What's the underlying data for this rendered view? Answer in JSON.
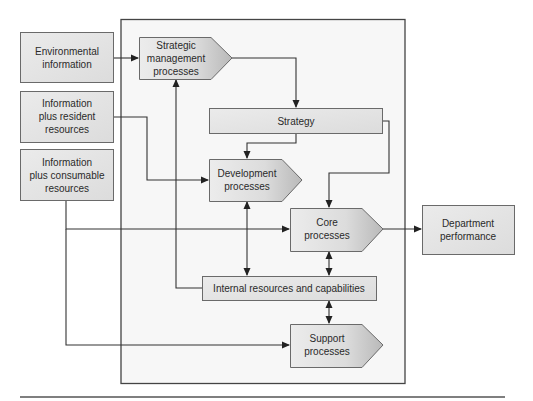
{
  "diagram": {
    "inputs": {
      "environmental": [
        "Environmental",
        "information"
      ],
      "resident": [
        "Information",
        "plus resident",
        "resources"
      ],
      "consumable": [
        "Information",
        "plus consumable",
        "resources"
      ]
    },
    "processes": {
      "strategic": [
        "Strategic",
        "management",
        "processes"
      ],
      "strategy": [
        "Strategy"
      ],
      "development": [
        "Development",
        "processes"
      ],
      "core": [
        "Core",
        "processes"
      ],
      "internal": [
        "Internal resources and capabilities"
      ],
      "support": [
        "Support",
        "processes"
      ]
    },
    "outputs": {
      "department": [
        "Department",
        "performance"
      ]
    },
    "colors": {
      "box_fill": "#e6e6e6",
      "panel_fill": "#f7f7f7",
      "line": "#333333"
    }
  }
}
